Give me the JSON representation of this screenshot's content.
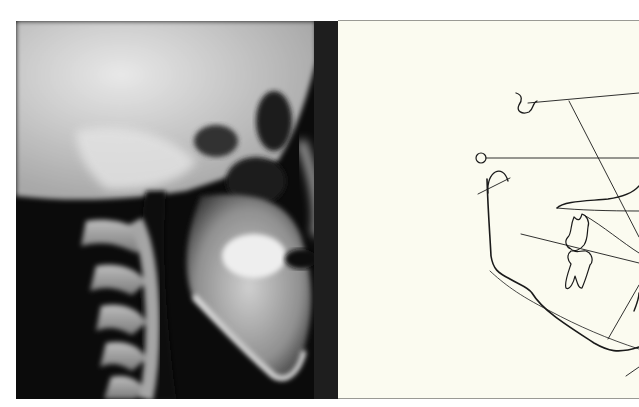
{
  "figure": {
    "left_panel": {
      "kind": "lateral cephalometric radiograph",
      "icon": "xray-skull-image"
    },
    "right_panel": {
      "kind": "cephalometric tracing",
      "icon": "tracing-diagram",
      "background_color": "#fbfbf0",
      "line_color": "#1a1a1a"
    }
  }
}
